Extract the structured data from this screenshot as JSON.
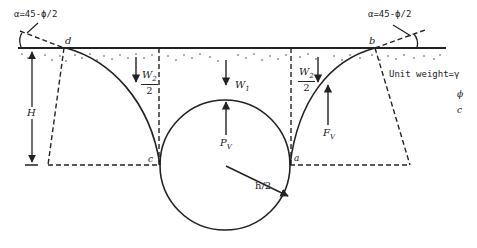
{
  "diagram": {
    "angle_label_left": "α=45-ϕ/2",
    "angle_label_right": "α=45-ϕ/2",
    "points": {
      "d": "d",
      "b": "b",
      "c": "c",
      "a": "a"
    },
    "depth_label": "H",
    "loads": {
      "w1": "W",
      "w1_sub": "1",
      "w2_num": "W",
      "w2_sub": "2",
      "w2_den": "2",
      "pv": "P",
      "pv_sub": "V",
      "fv": "F",
      "fv_sub": "V"
    },
    "radius_label": "h/2",
    "soil_properties": {
      "unit_weight": "Unit weight=γ",
      "friction_angle": "ϕ",
      "cohesion": "c"
    },
    "colors": {
      "line": "#222222",
      "background": "#ffffff"
    }
  }
}
